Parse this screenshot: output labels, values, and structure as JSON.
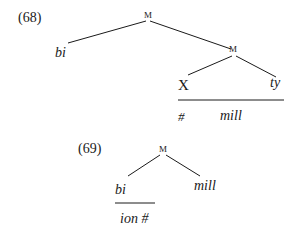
{
  "trees": [
    {
      "number": "(68)",
      "root": "M",
      "left_leaf": "bi",
      "inner_node": "M",
      "inner_left": "X",
      "inner_right": "ty",
      "below_line": [
        "#",
        "mill"
      ]
    },
    {
      "number": "(69)",
      "root": "M",
      "left_leaf": "bi",
      "right_leaf": "mill",
      "below_line": "ion #"
    }
  ],
  "colors": {
    "ink": "#1a1a1a",
    "background": "#ffffff"
  }
}
